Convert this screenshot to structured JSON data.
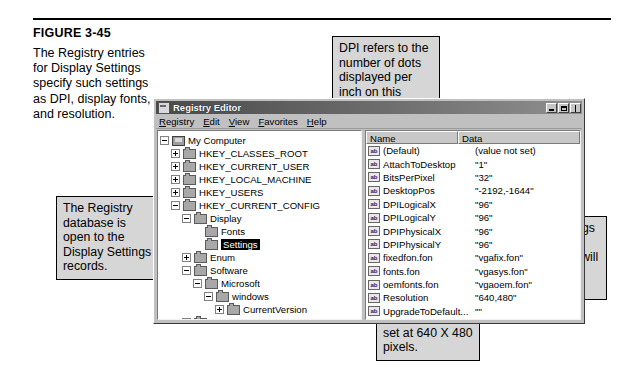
{
  "figure": {
    "label": "FIGURE 3-45",
    "caption": "The Registry entries for Display Settings specify such settings as DPI, display fonts, and resolution."
  },
  "callouts": {
    "registry_db": "The Registry database is open to the Display Settings records.",
    "dpi": "DPI refers to the number of dots displayed per inch on this computer's display device.",
    "font": "The font settings specify which font Windows will use on the desktop.",
    "resolution": "The resolution is set at 640 X 480 pixels."
  },
  "window": {
    "title": "Registry Editor",
    "icon": "registry-editor-icon",
    "buttons": [
      {
        "name": "minimize-button",
        "glyph": "minimize-icon"
      },
      {
        "name": "restore-button",
        "glyph": "restore-icon"
      },
      {
        "name": "close-button",
        "glyph": "close-icon"
      }
    ],
    "menus": [
      {
        "pre": "",
        "accel": "R",
        "post": "egistry"
      },
      {
        "pre": "",
        "accel": "E",
        "post": "dit"
      },
      {
        "pre": "",
        "accel": "V",
        "post": "iew"
      },
      {
        "pre": "",
        "accel": "F",
        "post": "avorites"
      },
      {
        "pre": "",
        "accel": "H",
        "post": "elp"
      }
    ]
  },
  "tree": [
    {
      "label": "My Computer",
      "indent": 0,
      "expander": "minus",
      "icon": "computer",
      "selected": false
    },
    {
      "label": "HKEY_CLASSES_ROOT",
      "indent": 1,
      "expander": "plus",
      "icon": "folder",
      "selected": false
    },
    {
      "label": "HKEY_CURRENT_USER",
      "indent": 1,
      "expander": "plus",
      "icon": "folder",
      "selected": false
    },
    {
      "label": "HKEY_LOCAL_MACHINE",
      "indent": 1,
      "expander": "plus",
      "icon": "folder",
      "selected": false
    },
    {
      "label": "HKEY_USERS",
      "indent": 1,
      "expander": "plus",
      "icon": "folder",
      "selected": false
    },
    {
      "label": "HKEY_CURRENT_CONFIG",
      "indent": 1,
      "expander": "minus",
      "icon": "folder",
      "selected": false
    },
    {
      "label": "Display",
      "indent": 2,
      "expander": "minus",
      "icon": "folder",
      "selected": false
    },
    {
      "label": "Fonts",
      "indent": 3,
      "expander": "none",
      "icon": "folder",
      "selected": false
    },
    {
      "label": "Settings",
      "indent": 3,
      "expander": "none",
      "icon": "folder",
      "selected": true
    },
    {
      "label": "Enum",
      "indent": 2,
      "expander": "plus",
      "icon": "folder",
      "selected": false
    },
    {
      "label": "Software",
      "indent": 2,
      "expander": "minus",
      "icon": "folder",
      "selected": false
    },
    {
      "label": "Microsoft",
      "indent": 3,
      "expander": "minus",
      "icon": "folder",
      "selected": false
    },
    {
      "label": "windows",
      "indent": 4,
      "expander": "minus",
      "icon": "folder",
      "selected": false
    },
    {
      "label": "CurrentVersion",
      "indent": 5,
      "expander": "plus",
      "icon": "folder",
      "selected": false
    },
    {
      "label": "System",
      "indent": 2,
      "expander": "plus",
      "icon": "folder",
      "selected": false
    },
    {
      "label": "HKEY_DYN_DATA",
      "indent": 1,
      "expander": "plus",
      "icon": "folder",
      "selected": false
    }
  ],
  "list": {
    "columns": [
      "Name",
      "Data"
    ],
    "rows": [
      {
        "name": "(Default)",
        "data": "(value not set)"
      },
      {
        "name": "AttachToDesktop",
        "data": "\"1\""
      },
      {
        "name": "BitsPerPixel",
        "data": "\"32\""
      },
      {
        "name": "DesktopPos",
        "data": "\"-2192,-1644\""
      },
      {
        "name": "DPILogicalX",
        "data": "\"96\""
      },
      {
        "name": "DPILogicalY",
        "data": "\"96\""
      },
      {
        "name": "DPIPhysicalX",
        "data": "\"96\""
      },
      {
        "name": "DPIPhysicalY",
        "data": "\"96\""
      },
      {
        "name": "fixedfon.fon",
        "data": "\"vgafix.fon\""
      },
      {
        "name": "fonts.fon",
        "data": "\"vgasys.fon\""
      },
      {
        "name": "oemfonts.fon",
        "data": "\"vgaoem.fon\""
      },
      {
        "name": "Resolution",
        "data": "\"640,480\""
      },
      {
        "name": "UpgradeToDefault...",
        "data": "\"\""
      }
    ]
  }
}
